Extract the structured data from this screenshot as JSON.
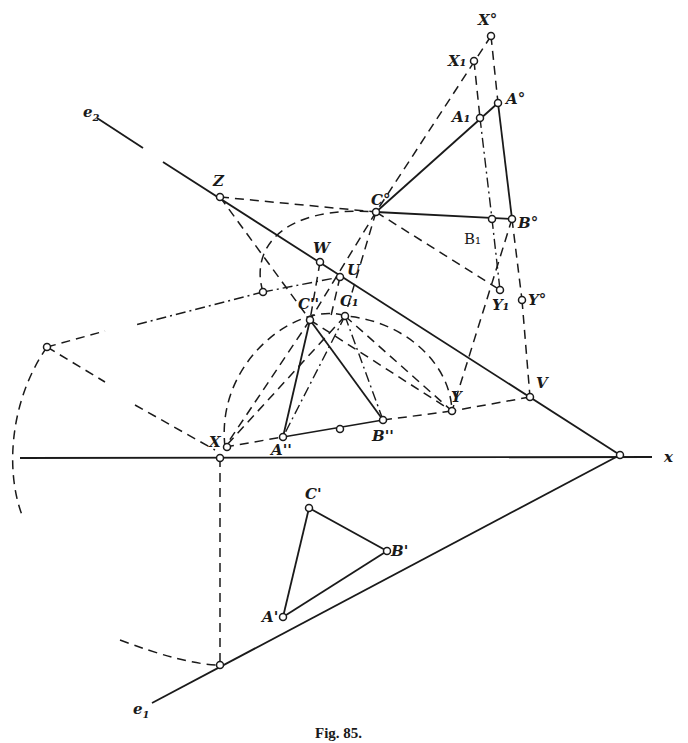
{
  "figure": {
    "caption": "Fig. 85.",
    "axis_label": "x",
    "traces": {
      "e1": "e",
      "e1_sub": "1",
      "e2": "e",
      "e2_sub": "2"
    },
    "points": {
      "X0": "X°",
      "X1": "X₁",
      "A1": "A₁",
      "A0": "A°",
      "C0": "C°",
      "B1": "B₁",
      "B0": "B°",
      "Y1": "Y₁",
      "Y0": "Y°",
      "Z": "Z",
      "W": "W",
      "U": "U",
      "C2": "C''",
      "C1": "C₁",
      "V": "V",
      "Y": "Y",
      "X": "X",
      "A2": "A''",
      "B2": "B''",
      "Cp": "C'",
      "Bp": "B'",
      "Ap": "A'"
    }
  }
}
